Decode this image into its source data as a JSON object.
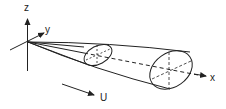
{
  "diagram": {
    "type": "conical-flow-coordinate-sketch",
    "axes": {
      "x": {
        "label": "x"
      },
      "y": {
        "label": "y"
      },
      "z": {
        "label": "z"
      }
    },
    "flow": {
      "label": "U"
    },
    "shapes": [
      "cone",
      "small-ellipse-cross-section",
      "large-ellipse-cross-section"
    ],
    "colors": {
      "stroke": "#222222",
      "background": "#ffffff"
    }
  }
}
